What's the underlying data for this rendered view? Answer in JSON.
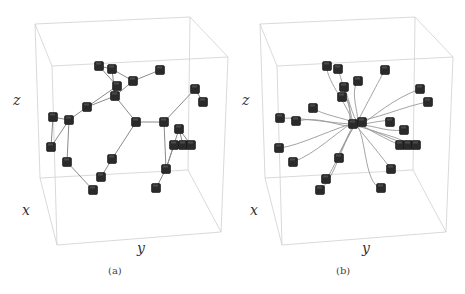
{
  "figure": {
    "panels": [
      {
        "id": "a",
        "caption": "(a)",
        "axis_labels": {
          "z": "z",
          "x": "x",
          "y": "y"
        },
        "description": "Graph of nodes (cubes) connected by straight edges inside a 3D bounding box",
        "box": {
          "back": [
            [
              35,
              24
            ],
            [
              190,
              17
            ],
            [
              228,
              57
            ],
            [
              52,
              66
            ]
          ],
          "front_bottom": [
            [
              57,
              245
            ],
            [
              221,
              232
            ]
          ],
          "back_bottom": [
            [
              40,
              178
            ],
            [
              188,
              170
            ]
          ]
        },
        "nodes": [
          [
            99,
            66
          ],
          [
            112,
            69
          ],
          [
            160,
            70
          ],
          [
            133,
            81
          ],
          [
            117,
            86
          ],
          [
            115,
            96
          ],
          [
            87,
            107
          ],
          [
            53,
            117
          ],
          [
            69,
            120
          ],
          [
            51,
            147
          ],
          [
            67,
            162
          ],
          [
            136,
            122
          ],
          [
            164,
            122
          ],
          [
            112,
            159
          ],
          [
            101,
            177
          ],
          [
            93,
            190
          ],
          [
            195,
            89
          ],
          [
            203,
            102
          ],
          [
            179,
            129
          ],
          [
            174,
            145
          ],
          [
            183,
            145
          ],
          [
            191,
            145
          ],
          [
            166,
            169
          ],
          [
            156,
            188
          ]
        ],
        "edges": [
          [
            0,
            4
          ],
          [
            0,
            1
          ],
          [
            1,
            3
          ],
          [
            1,
            5
          ],
          [
            3,
            2
          ],
          [
            3,
            5
          ],
          [
            4,
            5
          ],
          [
            5,
            6
          ],
          [
            6,
            8
          ],
          [
            4,
            6
          ],
          [
            7,
            8
          ],
          [
            7,
            9
          ],
          [
            8,
            9
          ],
          [
            8,
            10
          ],
          [
            10,
            15
          ],
          [
            5,
            11
          ],
          [
            11,
            12
          ],
          [
            11,
            13
          ],
          [
            13,
            14
          ],
          [
            12,
            16
          ],
          [
            16,
            17
          ],
          [
            12,
            22
          ],
          [
            22,
            23
          ],
          [
            22,
            19
          ],
          [
            22,
            18
          ],
          [
            18,
            20
          ],
          [
            18,
            21
          ],
          [
            19,
            20
          ],
          [
            20,
            21
          ]
        ]
      },
      {
        "id": "b",
        "caption": "(b)",
        "axis_labels": {
          "z": "z",
          "x": "x",
          "y": "y"
        },
        "description": "Same nodes with curved trajectories converging toward a central cluster inside a 3D bounding box",
        "center": [
          355,
          124
        ],
        "nodes": [
          [
            327,
            66
          ],
          [
            338,
            69
          ],
          [
            385,
            70
          ],
          [
            358,
            81
          ],
          [
            344,
            87
          ],
          [
            342,
            97
          ],
          [
            313,
            108
          ],
          [
            280,
            118
          ],
          [
            296,
            121
          ],
          [
            279,
            148
          ],
          [
            293,
            162
          ],
          [
            339,
            158
          ],
          [
            326,
            179
          ],
          [
            320,
            190
          ],
          [
            420,
            89
          ],
          [
            428,
            102
          ],
          [
            390,
            122
          ],
          [
            404,
            130
          ],
          [
            400,
            145
          ],
          [
            408,
            145
          ],
          [
            416,
            145
          ],
          [
            391,
            169
          ],
          [
            381,
            188
          ],
          [
            353,
            124
          ],
          [
            362,
            122
          ]
        ]
      }
    ]
  }
}
